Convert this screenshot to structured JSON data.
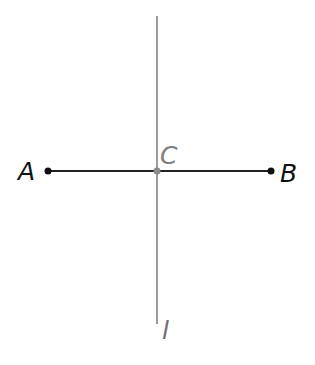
{
  "diagram": {
    "type": "perpendicular-bisector",
    "points": {
      "A": {
        "label": "A",
        "x": 48,
        "y": 171
      },
      "B": {
        "label": "B",
        "x": 271,
        "y": 171
      },
      "C": {
        "label": "C",
        "x": 157,
        "y": 171
      }
    },
    "segment": {
      "from": "A",
      "to": "B",
      "color": "#222222"
    },
    "line": {
      "label": "l",
      "x": 157,
      "y1": 16,
      "y2": 324,
      "color": "#9a9a9a"
    },
    "colors": {
      "segment": "#222222",
      "bisector": "#9a9a9a",
      "label_c": "#808080",
      "label_l": "#6e6e6e",
      "label_ab": "#111111"
    }
  }
}
